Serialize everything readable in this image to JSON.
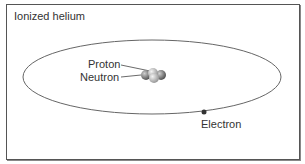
{
  "diagram": {
    "title": "Ionized helium",
    "labels": {
      "proton": "Proton",
      "neutron": "Neutron",
      "electron": "Electron"
    },
    "colors": {
      "orbit": "#666666",
      "frame": "#555555",
      "particle_dark": "#666666",
      "particle_light": "#bbbbbb",
      "electron": "#333333"
    }
  }
}
